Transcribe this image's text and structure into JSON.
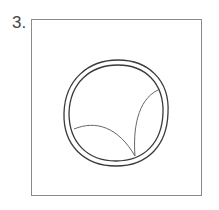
{
  "figure": {
    "number_label": "3.",
    "content": "line drawing of a round ring containing two curved lines",
    "stroke_color": "#3a3a3a",
    "frame_color": "#8a8a8a"
  }
}
